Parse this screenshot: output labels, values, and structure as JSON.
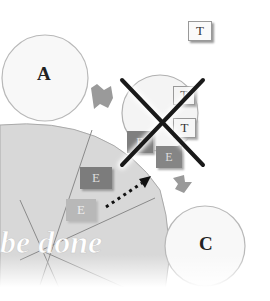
{
  "diagram": {
    "nodes": {
      "A": {
        "label": "A"
      },
      "C": {
        "label": "C"
      }
    },
    "cards": {
      "t_top": {
        "label": "T"
      },
      "t_mid_1": {
        "label": "T"
      },
      "t_mid_2": {
        "label": "T"
      },
      "e_center_1": {
        "label": "E"
      },
      "e_center_2": {
        "label": "E"
      },
      "e_left_1": {
        "label": "E"
      },
      "e_left_2": {
        "label": "E"
      }
    },
    "overlay_text": "be done",
    "colors": {
      "circle_fill": "#f7f7f7",
      "circle_stroke": "#b5b5b5",
      "pie_fill": "#d7d7d7",
      "pie_lines": "#8a8a8a",
      "arrow_gray": "#9a9a9a",
      "card_dark": "#7f7f7f",
      "card_light": "#b9b9b9",
      "cross": "#1a1a1a"
    }
  }
}
